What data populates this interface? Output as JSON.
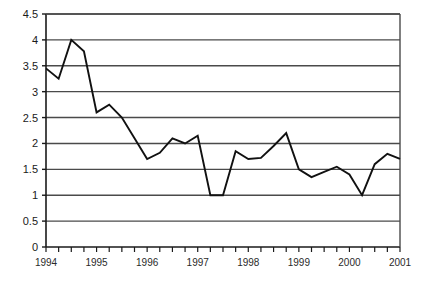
{
  "chart_data": {
    "type": "line",
    "title": "",
    "subtitle": "",
    "xlabel": "",
    "ylabel": "",
    "grid": true,
    "legend": null,
    "legend_position": "none",
    "xlim": [
      1994,
      2001
    ],
    "ylim": [
      0,
      4.5
    ],
    "ytick_labels": [
      "0",
      "0.5",
      "1",
      "1.5",
      "2",
      "2.5",
      "3",
      "3.5",
      "4",
      "4.5"
    ],
    "ytick_values": [
      0,
      0.5,
      1,
      1.5,
      2,
      2.5,
      3,
      3.5,
      4,
      4.5
    ],
    "xtick_labels": [
      "1994",
      "1995",
      "1996",
      "1997",
      "1998",
      "1999",
      "2000",
      "2001"
    ],
    "xtick_values": [
      1994,
      1995,
      1996,
      1997,
      1998,
      1999,
      2000,
      2001
    ],
    "x_minor_tick_interval": 0.25,
    "line_color": "#111111",
    "grid_color": "#4a4a4a",
    "axis_color": "#1a1a1a",
    "series": [
      {
        "name": "series-1",
        "x": [
          1994.0,
          1994.25,
          1994.5,
          1994.75,
          1995.0,
          1995.25,
          1995.5,
          1995.75,
          1996.0,
          1996.25,
          1996.5,
          1996.75,
          1997.0,
          1997.25,
          1997.5,
          1997.75,
          1998.0,
          1998.25,
          1998.5,
          1998.75,
          1999.0,
          1999.25,
          1999.5,
          1999.75,
          2000.0,
          2000.25,
          2000.5,
          2000.75,
          2001.0
        ],
        "values": [
          3.45,
          3.25,
          4.0,
          3.78,
          2.6,
          2.75,
          2.5,
          2.1,
          1.7,
          1.82,
          2.1,
          2.0,
          2.15,
          1.0,
          1.0,
          1.85,
          1.7,
          1.72,
          1.95,
          2.2,
          1.5,
          1.35,
          1.45,
          1.55,
          1.4,
          1.0,
          1.6,
          1.8,
          1.7
        ]
      }
    ]
  },
  "axes": {
    "plot_left": 46,
    "plot_right": 400,
    "plot_top": 14,
    "plot_bottom": 247
  }
}
